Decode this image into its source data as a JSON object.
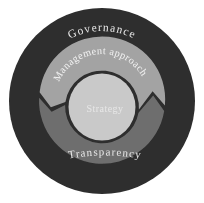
{
  "figure": {
    "type": "concentric-rings-cycle-diagram",
    "background_color": "#ffffff",
    "rings": [
      {
        "position": "outer-ring",
        "label": "Governance",
        "color": "#2d2d2d",
        "text_color": "#f1f1f1"
      },
      {
        "position": "middle-ring-top-arrow",
        "label": "Management approach",
        "color": "#a3a3a3",
        "text_color": "#f6f6f6"
      },
      {
        "position": "middle-ring-bottom-arrow",
        "label": "Transparency",
        "color": "#6e6e6e",
        "text_color": "#ededed"
      },
      {
        "position": "center-circle",
        "label": "Strategy",
        "color": "#c9c9c9",
        "text_color": "#e9e9e9"
      }
    ],
    "flow_direction": "counterclockwise"
  }
}
